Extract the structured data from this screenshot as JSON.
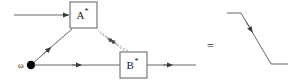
{
  "diagram": {
    "title": "",
    "colors": {
      "line": "#555555",
      "box_stroke": "#6b6b6b",
      "box_fill": "#ffffff",
      "dashed_line": "#8a8a8a",
      "node_fill": "#000000",
      "text": "#1a1a1a"
    },
    "blocks": [
      {
        "id": "block-a",
        "base_label": "A",
        "superscript": "*",
        "full_label": "A*",
        "x": 70,
        "y": 2,
        "width": 27,
        "height": 26
      },
      {
        "id": "block-b",
        "base_label": "B",
        "superscript": "*",
        "full_label": "B*",
        "x": 120,
        "y": 52,
        "width": 27,
        "height": 26
      }
    ],
    "nodes": [
      {
        "id": "source-node",
        "label": "ω",
        "label_name": "omega",
        "cx": 31,
        "cy": 65,
        "r": 4.2
      }
    ],
    "operators": [
      {
        "id": "equals-sign",
        "label": "=",
        "x": 210,
        "y": 46
      }
    ],
    "edges": [
      {
        "id": "edge-input-a",
        "kind": "solid",
        "from": "left-boundary",
        "to": "block-a",
        "arrow": "end"
      },
      {
        "id": "edge-node-a",
        "kind": "solid",
        "from": "source-node",
        "to": "block-a",
        "arrow": "mid"
      },
      {
        "id": "edge-a-b-upper",
        "kind": "dashed",
        "from": "block-b",
        "to": "block-a",
        "arrow": "mid"
      },
      {
        "id": "edge-a-b-lower",
        "kind": "dashed",
        "from": "block-b",
        "to": "block-a",
        "arrow": "mid"
      },
      {
        "id": "edge-node-b",
        "kind": "solid",
        "from": "source-node",
        "to": "block-b",
        "arrow": "mid"
      },
      {
        "id": "edge-b-output",
        "kind": "solid",
        "from": "block-b",
        "to": "right-boundary",
        "arrow": "mid"
      }
    ],
    "waveform": {
      "id": "step-waveform",
      "description": "falling step signal",
      "points": "227,13 241,13 271,64 288,64",
      "arrow": "mid"
    }
  }
}
